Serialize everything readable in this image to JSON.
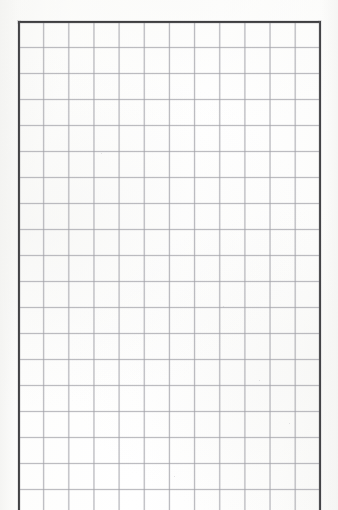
{
  "document": {
    "kind": "scanned-grid-paper",
    "title": "Blank grid paper sheet",
    "content_text": "",
    "visible_text_count": 0,
    "is_blank": true
  },
  "canvas": {
    "width_px": 338,
    "height_px": 510,
    "background_color": "#fdfdfd",
    "paper_tint_color": "#f6f6f4"
  },
  "frame": {
    "description": "Heavy printed border rule on top, left and right; sheet is cropped at the bottom so no bottom rule is visible.",
    "color": "#33333",
    "rule_color": "#323234",
    "left_edge_x": 18,
    "right_edge_x": 320,
    "top_edge_y": 21,
    "bottom_edge_visible": false,
    "top_rule_label": "top border rule",
    "left_rule_label": "left border rule",
    "right_rule_label": "right border rule"
  },
  "grid": {
    "description": "Uniform square ruling, single scale, no minor subdivisions.",
    "line_color": "#96969e",
    "cell_width_px": 25.17,
    "cell_height_px": 26.0,
    "columns_visible": 12,
    "rows_visible": 19,
    "has_minor_gridlines": false,
    "block_left_px": 18,
    "block_top_px": 21,
    "block_width_px": 302,
    "block_height_px": 489
  },
  "margins": {
    "left_label": "left margin",
    "right_label": "right margin",
    "top_label": "top margin",
    "left_width_px": 18,
    "right_width_px": 17,
    "top_height_px": 21,
    "color": "#f4f4f2"
  },
  "artifacts": {
    "specks": [
      {
        "x": 101,
        "y": 153,
        "size": 1.4
      },
      {
        "x": 259,
        "y": 380,
        "size": 1.3
      },
      {
        "x": 223,
        "y": 306,
        "size": 1.1
      },
      {
        "x": 289,
        "y": 423,
        "size": 1.2
      },
      {
        "x": 174,
        "y": 476,
        "size": 1.0
      }
    ]
  }
}
